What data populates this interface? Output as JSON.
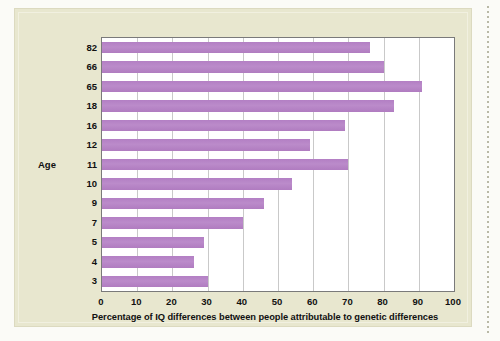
{
  "figure": {
    "background_color": "#e8e7cf",
    "plot_background_color": "#ffffff",
    "bar_color": "#b07cc0",
    "gridline_color": "#c9c9c9",
    "axis_color": "#7a7a7a"
  },
  "chart_data": {
    "type": "bar",
    "orientation": "horizontal",
    "title": "",
    "xlabel": "Percentage of IQ differences between people attributable to genetic differences",
    "ylabel": "Age",
    "categories": [
      "82",
      "66",
      "65",
      "18",
      "16",
      "12",
      "11",
      "10",
      "9",
      "7",
      "5",
      "4",
      "3"
    ],
    "values": [
      76,
      80,
      91,
      83,
      69,
      59,
      70,
      54,
      46,
      40,
      29,
      26,
      30
    ],
    "xlim": [
      0,
      100
    ],
    "xticks": [
      0,
      10,
      20,
      30,
      40,
      50,
      60,
      70,
      80,
      90,
      100
    ],
    "xtick_labels": [
      "0",
      "10",
      "20",
      "30",
      "40",
      "50",
      "60",
      "70",
      "80",
      "90",
      "100"
    ],
    "grid": "vertical",
    "legend": "none"
  }
}
